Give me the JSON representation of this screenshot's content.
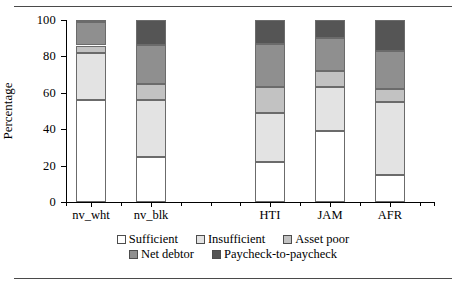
{
  "chart_data": {
    "type": "bar",
    "stacked": true,
    "title": "",
    "xlabel": "",
    "ylabel": "Percentage",
    "ylim": [
      0,
      100
    ],
    "yticks": [
      0,
      20,
      40,
      60,
      80,
      100
    ],
    "grid": false,
    "legend_position": "bottom",
    "categories": [
      "nv_wht",
      "nv_blk",
      "HTI",
      "JAM",
      "AFR"
    ],
    "series": [
      {
        "name": "Sufficient",
        "color": "#ffffff",
        "values": [
          56,
          25,
          22,
          39,
          15
        ]
      },
      {
        "name": "Insufficient",
        "color": "#e3e3e3",
        "values": [
          26,
          31,
          27,
          24,
          40
        ]
      },
      {
        "name": "Asset poor",
        "color": "#c2c2c2",
        "values": [
          4,
          9,
          14,
          9,
          7
        ]
      },
      {
        "name": "Net debtor",
        "color": "#8f8f8f",
        "values": [
          13,
          21,
          24,
          18,
          21
        ]
      },
      {
        "name": "Paycheck-to-paycheck",
        "color": "#555555",
        "values": [
          1,
          14,
          13,
          10,
          17
        ]
      }
    ]
  },
  "axis": {
    "ylabel": "Percentage",
    "ytick_labels": [
      "0",
      "20",
      "40",
      "60",
      "80",
      "100"
    ],
    "xtick_labels": [
      "nv_wht",
      "nv_blk",
      "HTI",
      "JAM",
      "AFR"
    ]
  },
  "legend": {
    "row1": [
      {
        "label": "Sufficient",
        "color": "#ffffff"
      },
      {
        "label": "Insufficient",
        "color": "#e3e3e3"
      },
      {
        "label": "Asset poor",
        "color": "#c2c2c2"
      }
    ],
    "row2": [
      {
        "label": "Net debtor",
        "color": "#8f8f8f"
      },
      {
        "label": "Paycheck-to-paycheck",
        "color": "#555555"
      }
    ]
  },
  "colors": {
    "rule": "#4a4a4a",
    "axis": "#000000",
    "segment_border": "#6b6b6b"
  }
}
